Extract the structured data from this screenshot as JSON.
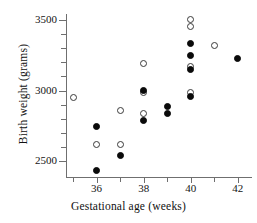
{
  "chart_data": {
    "type": "scatter",
    "title": "",
    "xlabel": "Gestational age (weeks)",
    "ylabel": "Birth weight (grams)",
    "xlim": [
      34.7,
      42.6
    ],
    "ylim": [
      2390,
      3540
    ],
    "grid": false,
    "legend": null,
    "xticks": [
      36,
      38,
      40,
      42
    ],
    "xtick_labels": [
      "36",
      "38",
      "40",
      "42"
    ],
    "yticks": [
      2500,
      3000,
      3500
    ],
    "ytick_labels": [
      "2500",
      "3000",
      "3500"
    ],
    "yminor_ticks": [
      2600,
      2700,
      2800,
      2900,
      3100,
      3200,
      3300,
      3400
    ],
    "xminor_ticks": [
      35,
      37,
      39,
      41
    ],
    "marker_styles": {
      "open": "open circle (hollow, dark outline)",
      "filled": "filled circle (solid black)"
    },
    "colors": {
      "filled_marker": "#0a0a0a",
      "open_marker_edge": "#3a3a3a",
      "open_marker_face": "#ffffff",
      "axis": "#6f6f6f",
      "text": "#141414",
      "background": "#ffffff"
    },
    "points": [
      {
        "x": 35,
        "y": 2950,
        "style": "open"
      },
      {
        "x": 36,
        "y": 2745,
        "style": "filled"
      },
      {
        "x": 36,
        "y": 2620,
        "style": "open"
      },
      {
        "x": 36,
        "y": 2435,
        "style": "filled"
      },
      {
        "x": 37,
        "y": 2860,
        "style": "open"
      },
      {
        "x": 37,
        "y": 2620,
        "style": "open"
      },
      {
        "x": 37,
        "y": 2540,
        "style": "filled"
      },
      {
        "x": 38,
        "y": 3190,
        "style": "open"
      },
      {
        "x": 38,
        "y": 3000,
        "style": "filled"
      },
      {
        "x": 38,
        "y": 2985,
        "style": "open"
      },
      {
        "x": 38,
        "y": 2840,
        "style": "open"
      },
      {
        "x": 38,
        "y": 2790,
        "style": "filled"
      },
      {
        "x": 39,
        "y": 2890,
        "style": "filled"
      },
      {
        "x": 39,
        "y": 2835,
        "style": "filled"
      },
      {
        "x": 40,
        "y": 3500,
        "style": "open"
      },
      {
        "x": 40,
        "y": 3455,
        "style": "open"
      },
      {
        "x": 40,
        "y": 3330,
        "style": "filled"
      },
      {
        "x": 40,
        "y": 3245,
        "style": "filled"
      },
      {
        "x": 40,
        "y": 3170,
        "style": "open"
      },
      {
        "x": 40,
        "y": 3150,
        "style": "filled"
      },
      {
        "x": 40,
        "y": 2985,
        "style": "open"
      },
      {
        "x": 40,
        "y": 2960,
        "style": "filled"
      },
      {
        "x": 41,
        "y": 3315,
        "style": "open"
      },
      {
        "x": 42,
        "y": 3225,
        "style": "filled"
      }
    ]
  }
}
